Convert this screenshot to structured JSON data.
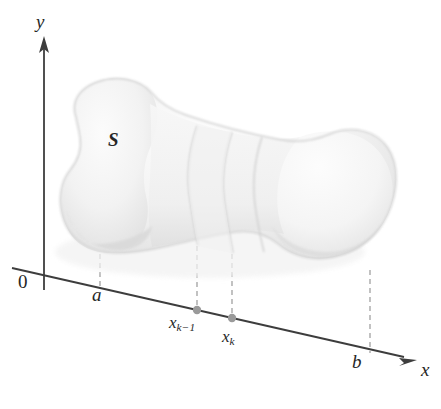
{
  "figure": {
    "kind": "calculus-solid-cross-section-diagram",
    "background_color": "#ffffff",
    "axis_color": "#3d3d3d",
    "dash_color": "#a8a8a8",
    "point_color": "#9a9a9a",
    "solid_fill_light": "#f4f4f4",
    "solid_fill_mid": "#ebebeb",
    "solid_fill_dark": "#d9d9d9",
    "solid_outline": "#d3d3d3",
    "label_color": "#262626"
  },
  "labels": {
    "y_axis": "y",
    "x_axis": "x",
    "origin": "0",
    "left_bound": "a",
    "right_bound": "b",
    "solid": "S",
    "slice_left_base": "x",
    "slice_left_sub": "k−1",
    "slice_right_base": "x",
    "slice_right_sub": "k"
  },
  "axes": {
    "y_axis": {
      "x": 44,
      "y_top": 40,
      "y_bottom": 290,
      "arrow": "up"
    },
    "x_axis": {
      "x_start": 12,
      "y_start": 268,
      "x_end": 416,
      "y_end": 360,
      "arrow": "right"
    }
  },
  "marked_points": [
    {
      "name": "x_k_minus_1",
      "x": 197,
      "y": 310
    },
    {
      "name": "x_k",
      "x": 232,
      "y": 318
    }
  ],
  "dashed_projections": [
    {
      "name": "a-projection",
      "x_top": 100,
      "y_top": 256,
      "x_bottom": 100,
      "y_bottom": 288
    },
    {
      "name": "xk1-projection",
      "x_top": 197,
      "y_top": 248,
      "x_bottom": 197,
      "y_bottom": 310
    },
    {
      "name": "xk-projection",
      "x_top": 232,
      "y_top": 256,
      "x_bottom": 232,
      "y_bottom": 318
    },
    {
      "name": "b-projection",
      "x_top": 370,
      "y_top": 272,
      "x_bottom": 370,
      "y_bottom": 352
    }
  ],
  "cross_section_slices": [
    {
      "name": "slice-boundary-left",
      "at_label": "x_k_minus_1"
    },
    {
      "name": "slice-boundary-right",
      "at_label": "x_k"
    },
    {
      "name": "slice-boundary-extra",
      "at_label": "unlabeled"
    }
  ]
}
